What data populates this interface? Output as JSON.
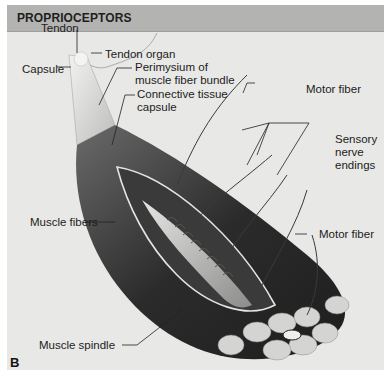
{
  "header": {
    "title": "PROPRIOCEPTORS"
  },
  "panel_letter": "B",
  "labels": {
    "tendon": "Tendon",
    "tendon_organ": "Tendon organ",
    "capsule": "Capsule",
    "perimysium_line1": "Perimysium of",
    "perimysium_line2": "muscle fiber bundle",
    "connective_line1": "Connective tissue",
    "connective_line2": "capsule",
    "motor_fiber_top": "Motor fiber",
    "sensory_line1": "Sensory",
    "sensory_line2": "nerve",
    "sensory_line3": "endings",
    "muscle_fibers": "Muscle fibers",
    "motor_fiber_right": "Motor fiber",
    "muscle_spindle": "Muscle spindle"
  },
  "colors": {
    "header_bg": "#b3b3b2",
    "figure_bg": "#e8e8e6",
    "muscle_dark": "#2a2a2a",
    "muscle_mid": "#5a5a5a",
    "fascicle_cut": "#cfcfcf"
  }
}
